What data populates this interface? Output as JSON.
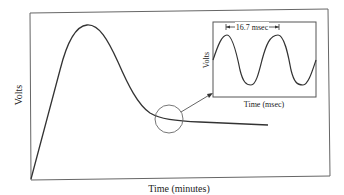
{
  "main_plot": {
    "x_label": "Time (minutes)",
    "y_label": "Volts",
    "curve": "rise to peak then decay to steady level"
  },
  "inset": {
    "x_label": "Time (msec)",
    "y_label": "Volts",
    "period_annotation": "16.7 msec",
    "waveform": "sine wave"
  },
  "zoom_callout": {
    "shape": "circle",
    "connector": "arrow to inset"
  },
  "colors": {
    "line": "#333333",
    "frame": "#555555",
    "background": "#ffffff"
  }
}
